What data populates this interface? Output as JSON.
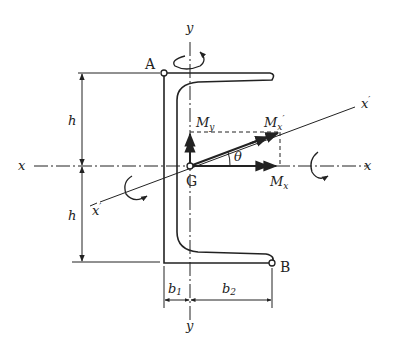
{
  "diagram": {
    "type": "channel-section-bending",
    "points": {
      "A": "A",
      "B": "B",
      "G": "G"
    },
    "axes": {
      "x_left": "x",
      "x_right": "x",
      "y_top": "y",
      "y_bottom": "y",
      "x_prime_right": "x",
      "x_prime_left": "x",
      "prime": "′"
    },
    "dimensions": {
      "h_top": "h",
      "h_bottom": "h",
      "b1": "b",
      "b1_sub": "1",
      "b2": "b",
      "b2_sub": "2"
    },
    "moments": {
      "My": "M",
      "My_sub": "y",
      "Mx": "M",
      "Mx_sub": "x",
      "Mx_prime": "M",
      "Mx_prime_sub": "x",
      "Mx_prime_mark": "′"
    },
    "angle": "θ",
    "colors": {
      "ink": "#222222",
      "background": "#ffffff"
    }
  }
}
